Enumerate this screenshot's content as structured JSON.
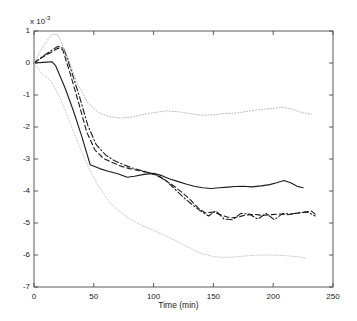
{
  "figure": {
    "background": "#ffffff",
    "axis_color": "#333333",
    "exponent_prefix": "x 10",
    "exponent_power": "-3"
  },
  "chart_data": {
    "type": "line",
    "title": "",
    "subtitle": "",
    "xlabel": "Time (min)",
    "ylabel": "",
    "y_exponent_label": "x 10^-3",
    "y_scale_factor": 0.001,
    "xlim": [
      0,
      250
    ],
    "ylim": [
      -7,
      1
    ],
    "xticks": [
      0,
      50,
      100,
      150,
      200,
      250
    ],
    "xticklabels": [
      "0",
      "50",
      "100",
      "150",
      "200",
      "250"
    ],
    "yticks": [
      1,
      0,
      -1,
      -2,
      -3,
      -4,
      -5,
      -6,
      -7
    ],
    "yticklabels": [
      "1",
      "0",
      "-1",
      "-2",
      "-3",
      "-4",
      "-5",
      "-6",
      "-7"
    ],
    "grid": false,
    "legend": "none",
    "legend_position": "none",
    "annotations": [],
    "series": [
      {
        "name": "mean-solid",
        "style": "solid",
        "color": "#1a1a1a",
        "width": 1.1,
        "x": [
          0,
          8,
          15,
          18,
          26,
          33,
          40,
          47,
          55,
          62,
          70,
          78,
          84,
          92,
          100,
          107,
          113,
          120,
          127,
          134,
          141,
          148,
          155,
          162,
          168,
          175,
          182,
          190,
          197,
          203,
          209,
          215,
          220,
          225
        ],
        "y": [
          0.0,
          0.02,
          0.04,
          -0.08,
          -0.78,
          -1.5,
          -2.3,
          -3.18,
          -3.3,
          -3.38,
          -3.46,
          -3.57,
          -3.54,
          -3.48,
          -3.45,
          -3.52,
          -3.62,
          -3.7,
          -3.78,
          -3.85,
          -3.9,
          -3.92,
          -3.9,
          -3.88,
          -3.86,
          -3.85,
          -3.87,
          -3.84,
          -3.8,
          -3.74,
          -3.67,
          -3.75,
          -3.85,
          -3.9
        ]
      },
      {
        "name": "dashed-estimate",
        "style": "dashed",
        "color": "#1a1a1a",
        "width": 1.1,
        "x": [
          0,
          7,
          14,
          20,
          24,
          30,
          37,
          44,
          51,
          58,
          66,
          73,
          80,
          87,
          95,
          102,
          109,
          116,
          123,
          130,
          137,
          143,
          150,
          157,
          164,
          170,
          177,
          184,
          191,
          198,
          205,
          212,
          219,
          226,
          232,
          236
        ],
        "y": [
          0.0,
          0.18,
          0.33,
          0.46,
          0.42,
          -0.3,
          -1.2,
          -2.15,
          -2.72,
          -2.98,
          -3.12,
          -3.23,
          -3.3,
          -3.36,
          -3.42,
          -3.5,
          -3.64,
          -3.82,
          -4.02,
          -4.25,
          -4.52,
          -4.68,
          -4.66,
          -4.76,
          -4.84,
          -4.82,
          -4.75,
          -4.73,
          -4.76,
          -4.74,
          -4.72,
          -4.74,
          -4.7,
          -4.66,
          -4.63,
          -4.75
        ]
      },
      {
        "name": "dashdot-estimate",
        "style": "dashdot",
        "color": "#1a1a1a",
        "width": 1.1,
        "x": [
          0,
          7,
          14,
          20,
          25,
          31,
          38,
          45,
          52,
          60,
          67,
          75,
          82,
          90,
          97,
          104,
          111,
          118,
          125,
          132,
          139,
          146,
          152,
          159,
          166,
          173,
          180,
          187,
          194,
          201,
          208,
          215,
          222,
          229,
          235
        ],
        "y": [
          0.0,
          0.2,
          0.38,
          0.52,
          0.45,
          -0.22,
          -1.05,
          -1.95,
          -2.55,
          -2.88,
          -3.05,
          -3.18,
          -3.28,
          -3.36,
          -3.44,
          -3.52,
          -3.7,
          -3.95,
          -4.2,
          -4.42,
          -4.62,
          -4.78,
          -4.62,
          -4.88,
          -4.9,
          -4.7,
          -4.72,
          -4.88,
          -4.7,
          -4.9,
          -4.7,
          -4.72,
          -4.68,
          -4.66,
          -4.78
        ]
      },
      {
        "name": "upper-confidence-dotted",
        "style": "dotted",
        "color": "#b9b9b9",
        "width": 1.0,
        "x": [
          0,
          8,
          15,
          20,
          28,
          36,
          45,
          54,
          63,
          72,
          80,
          90,
          100,
          110,
          120,
          130,
          140,
          150,
          160,
          170,
          180,
          190,
          200,
          208,
          216,
          224,
          232
        ],
        "y": [
          0.0,
          0.55,
          0.9,
          0.88,
          0.2,
          -0.62,
          -1.25,
          -1.55,
          -1.68,
          -1.72,
          -1.7,
          -1.62,
          -1.55,
          -1.5,
          -1.52,
          -1.58,
          -1.63,
          -1.62,
          -1.58,
          -1.56,
          -1.5,
          -1.45,
          -1.42,
          -1.38,
          -1.45,
          -1.55,
          -1.6
        ]
      },
      {
        "name": "lower-confidence-dotted",
        "style": "dotted",
        "color": "#c4c4c4",
        "width": 1.0,
        "x": [
          0,
          7,
          14,
          22,
          30,
          38,
          46,
          54,
          62,
          70,
          78,
          86,
          95,
          104,
          113,
          122,
          131,
          140,
          150,
          160,
          170,
          180,
          190,
          200,
          210,
          220,
          228
        ],
        "y": [
          0.0,
          -0.35,
          -0.55,
          -1.1,
          -1.85,
          -2.6,
          -3.3,
          -3.85,
          -4.3,
          -4.6,
          -4.82,
          -5.0,
          -5.15,
          -5.3,
          -5.45,
          -5.62,
          -5.8,
          -5.95,
          -6.05,
          -6.08,
          -6.05,
          -6.02,
          -6.0,
          -6.0,
          -6.02,
          -6.05,
          -6.1
        ]
      }
    ]
  }
}
